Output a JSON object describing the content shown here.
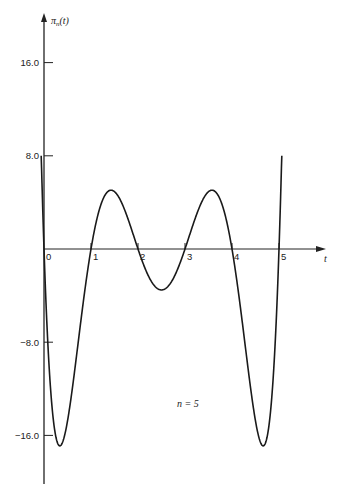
{
  "chart_data": {
    "type": "line",
    "title": "",
    "xlabel": "t",
    "ylabel": "π_n(t)",
    "ylabel_main": "π",
    "ylabel_sub": "n",
    "ylabel_tail": "(t)",
    "xlim": [
      0,
      5.5
    ],
    "ylim": [
      -20,
      20
    ],
    "grid": false,
    "legend": null,
    "x_ticks": [
      0,
      1,
      2,
      3,
      4,
      5
    ],
    "x_tick_labels": [
      "0",
      "1",
      "2",
      "3",
      "4",
      "5"
    ],
    "y_ticks": [
      16.0,
      8.0,
      -8.0,
      -16.0
    ],
    "y_tick_labels": [
      "16.0",
      "8.0",
      "−8.0",
      "−16.0"
    ],
    "annotation": "n = 5",
    "series": [
      {
        "name": "π_5(t) = t(t−1)(t−2)(t−3)(t−4)(t−5)",
        "roots": [
          0,
          1,
          2,
          3,
          4,
          5
        ],
        "t_range": [
          -0.06,
          5.06
        ],
        "key_points": [
          {
            "t": -0.06,
            "y": 8.0
          },
          {
            "t": 0.0,
            "y": 0.0
          },
          {
            "t": 0.26,
            "y": -16.9
          },
          {
            "t": 1.0,
            "y": 0.0
          },
          {
            "t": 1.4,
            "y": 5.0
          },
          {
            "t": 2.0,
            "y": 0.0
          },
          {
            "t": 2.5,
            "y": -3.5
          },
          {
            "t": 3.0,
            "y": 0.0
          },
          {
            "t": 3.6,
            "y": 5.0
          },
          {
            "t": 4.0,
            "y": 0.0
          },
          {
            "t": 4.74,
            "y": -16.9
          },
          {
            "t": 5.0,
            "y": 0.0
          },
          {
            "t": 5.06,
            "y": 8.0
          }
        ]
      }
    ]
  }
}
